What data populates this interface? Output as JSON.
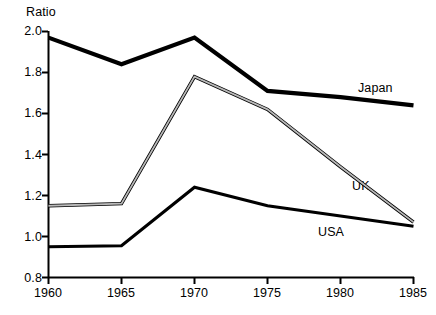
{
  "chart_data": {
    "type": "line",
    "title": "",
    "subtitle": "",
    "xlabel": "",
    "ylabel": "Ratio",
    "x": [
      1960,
      1965,
      1970,
      1975,
      1980,
      1985
    ],
    "xtick_labels": [
      "1960",
      "1965",
      "1970",
      "1975",
      "1980",
      "1985"
    ],
    "ytick_labels": [
      "0.8",
      "1.0",
      "1.2",
      "1.4",
      "1.6",
      "1.8",
      "2.0"
    ],
    "ytick_values": [
      0.8,
      1.0,
      1.2,
      1.4,
      1.6,
      1.8,
      2.0
    ],
    "xlim": [
      1960,
      1985
    ],
    "ylim": [
      0.8,
      2.0
    ],
    "grid": false,
    "legend_position": "inline-right-of-series",
    "series": [
      {
        "name": "Japan",
        "label": "Japan",
        "style": "thick-solid-black",
        "color": "#000000",
        "values": [
          1.97,
          1.84,
          1.97,
          1.71,
          1.68,
          1.64
        ]
      },
      {
        "name": "UK",
        "label": "UK",
        "style": "thin-outlined-gray",
        "color": "#7a7a7a",
        "values": [
          1.15,
          1.16,
          1.78,
          1.62,
          1.34,
          1.07
        ]
      },
      {
        "name": "USA",
        "label": "USA",
        "style": "medium-solid-black",
        "color": "#000000",
        "values": [
          0.95,
          0.955,
          1.24,
          1.15,
          1.1,
          1.05
        ]
      }
    ]
  },
  "axis": {
    "y_title": "Ratio"
  },
  "labels": {
    "japan": "Japan",
    "uk": "UK",
    "usa": "USA"
  },
  "colors": {
    "axis": "#000000",
    "japan": "#000000",
    "uk": "#7a7a7a",
    "usa": "#000000",
    "background": "#ffffff"
  }
}
